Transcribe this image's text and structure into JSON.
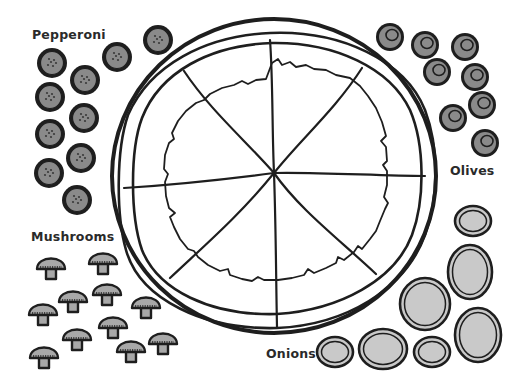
{
  "labels": {
    "pepperoni": "Pepperoni",
    "olives": "Olives",
    "mushrooms": "Mushrooms",
    "onions": "Onions"
  },
  "colors": {
    "ink": "#1e1e1e",
    "topping_fill": "#8a8a8a",
    "onion_fill": "#c9c9c9",
    "mushroom_fill": "#a8a8a8",
    "background": "#ffffff"
  },
  "pizza": {
    "center": [
      274,
      174
    ],
    "slices": 8
  },
  "toppings": {
    "pepperoni": [
      [
        52,
        63
      ],
      [
        85,
        80
      ],
      [
        50,
        97
      ],
      [
        84,
        118
      ],
      [
        50,
        134
      ],
      [
        81,
        158
      ],
      [
        49,
        173
      ],
      [
        77,
        200
      ],
      [
        117,
        57
      ],
      [
        158,
        40
      ]
    ],
    "olives": [
      [
        390,
        37
      ],
      [
        425,
        45
      ],
      [
        465,
        47
      ],
      [
        437,
        72
      ],
      [
        475,
        77
      ],
      [
        482,
        105
      ],
      [
        453,
        118
      ],
      [
        485,
        143
      ]
    ],
    "mushrooms": [
      [
        51,
        267
      ],
      [
        103,
        262
      ],
      [
        73,
        300
      ],
      [
        107,
        293
      ],
      [
        43,
        313
      ],
      [
        113,
        326
      ],
      [
        146,
        306
      ],
      [
        77,
        338
      ],
      [
        131,
        350
      ],
      [
        44,
        356
      ],
      [
        163,
        342
      ]
    ],
    "onions": [
      [
        473,
        221,
        18,
        15
      ],
      [
        470,
        272,
        22,
        27
      ],
      [
        425,
        304,
        25,
        26
      ],
      [
        478,
        335,
        23,
        27
      ],
      [
        335,
        352,
        18,
        15
      ],
      [
        383,
        349,
        24,
        20
      ],
      [
        432,
        352,
        18,
        15
      ]
    ]
  }
}
